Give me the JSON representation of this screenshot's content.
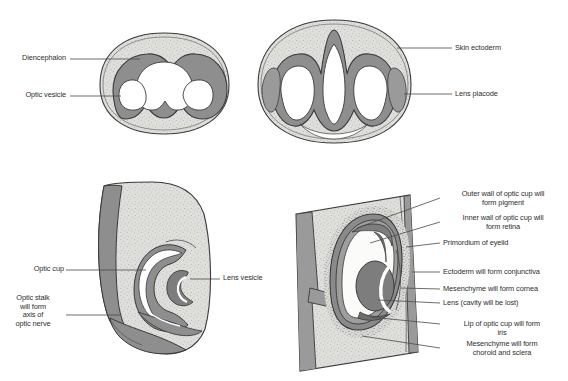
{
  "figure": {
    "background_color": "#ffffff",
    "colors": {
      "outline": "#3a3a3a",
      "neural_wall": "#8e8e8e",
      "neural_wall_dark": "#6f6f6f",
      "mesenchyme_fill": "#dcdcd8",
      "stipple": "#7a7a7a",
      "lumen": "#ffffff",
      "lens": "#8b8b8b",
      "label_text": "#2e2e2e",
      "leader_line": "#4a4a4a"
    },
    "panels": [
      {
        "id": "panel-optic-vesicle",
        "name": "optic-vesicle-stage",
        "position": "top-left",
        "labels": [
          {
            "id": "diencephalon",
            "text": "Diencephalon"
          },
          {
            "id": "optic-vesicle",
            "text": "Optic vesicle"
          }
        ]
      },
      {
        "id": "panel-lens-placode",
        "name": "lens-placode-stage",
        "position": "top-right",
        "labels": [
          {
            "id": "skin-ectoderm",
            "text": "Skin ectoderm"
          },
          {
            "id": "lens-placode",
            "text": "Lens placode"
          }
        ]
      },
      {
        "id": "panel-optic-cup",
        "name": "optic-cup-stage",
        "position": "bottom-left",
        "labels": [
          {
            "id": "optic-cup",
            "text": "Optic cup"
          },
          {
            "id": "lens-vesicle",
            "text": "Lens vesicle"
          },
          {
            "id": "optic-stalk",
            "text": "Optic stalk\nwill form\naxis of\noptic nerve"
          }
        ]
      },
      {
        "id": "panel-mature-eye",
        "name": "differentiating-eye-stage",
        "position": "bottom-right",
        "labels": [
          {
            "id": "outer-wall-pigment",
            "text": "Outer wall of optic cup will\nform pigment"
          },
          {
            "id": "inner-wall-retina",
            "text": "Inner wall of optic cup will\nform retina"
          },
          {
            "id": "primordium-eyelid",
            "text": "Primordium of eyelid"
          },
          {
            "id": "ectoderm-conjunctiva",
            "text": "Ectoderm will form conjunctiva"
          },
          {
            "id": "mesenchyme-cornea",
            "text": "Mesenchyme will form cornea"
          },
          {
            "id": "lens-cavity",
            "text": "Lens (cavity will be lost)"
          },
          {
            "id": "lip-optic-cup-iris",
            "text": "Lip of optic cup will form\niris"
          },
          {
            "id": "mesenchyme-choroid-sclera",
            "text": "Mesenchyme will form\nchoroid and sclera"
          }
        ]
      }
    ]
  }
}
